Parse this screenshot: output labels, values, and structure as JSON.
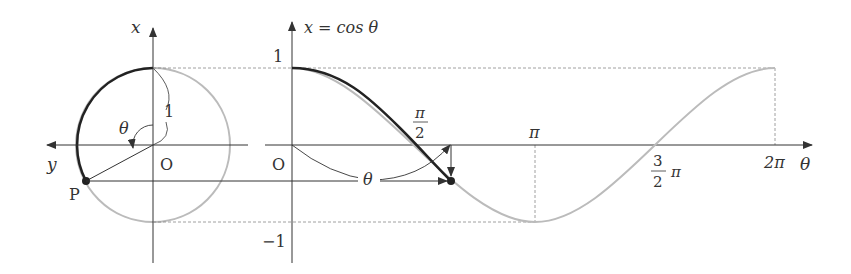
{
  "circle_panel": {
    "x_axis_label": "x",
    "y_axis_label": "y",
    "origin_label": "O",
    "radius_label": "1",
    "angle_label": "θ",
    "point_label": "P"
  },
  "graph_panel": {
    "y_axis_label": "x = cos θ",
    "origin_label": "O",
    "y_tick_top": "1",
    "y_tick_bottom": "−1",
    "tick_half_pi_num": "π",
    "tick_half_pi_den": "2",
    "tick_pi": "π",
    "tick_three_half_pi_num": "3",
    "tick_three_half_pi_den": "2",
    "tick_three_half_pi_suffix": "π",
    "tick_two_pi": "2π",
    "x_axis_label": "θ",
    "arc_angle_label": "θ"
  },
  "colors": {
    "axis": "#333333",
    "highlight_curve": "#222222",
    "faint_curve": "#bbbbbb",
    "dashed": "#888888"
  }
}
